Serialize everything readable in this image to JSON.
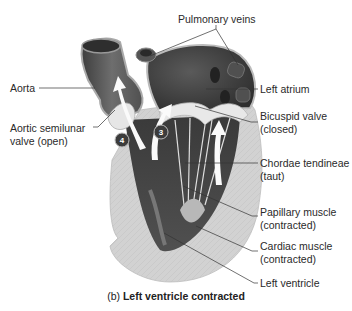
{
  "figure": {
    "caption_prefix": "(b)",
    "caption_title": "Left ventricle contracted",
    "labels": {
      "pulmonary_veins": "Pulmonary veins",
      "aorta": "Aorta",
      "left_atrium": "Left atrium",
      "aortic_valve_line1": "Aortic semilunar",
      "aortic_valve_line2": "valve (open)",
      "bicuspid_line1": "Bicuspid valve",
      "bicuspid_line2": "(closed)",
      "chordae_line1": "Chordae tendineae",
      "chordae_line2": "(taut)",
      "papillary_line1": "Papillary muscle",
      "papillary_line2": "(contracted)",
      "cardiac_line1": "Cardiac muscle",
      "cardiac_line2": "(contracted)",
      "left_ventricle": "Left ventricle"
    },
    "markers": [
      "4",
      "3"
    ],
    "colors": {
      "muscle_wall": "#d4d4d4",
      "chamber_dark": "#4a4a4a",
      "vessel": "#6a6a6a",
      "valve_light": "#e8e8e8",
      "leader_line": "#333333"
    }
  }
}
